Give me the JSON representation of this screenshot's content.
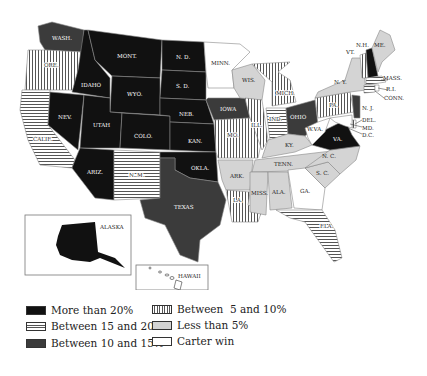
{
  "map": {
    "legend_colors": {
      "more_than_20": "#111111",
      "between_15_20": "horizontal-stripes",
      "between_10_15": "#3b3b3b",
      "between_5_10": "vertical-stripes",
      "less_than_5": "#d4d4d4",
      "carter_win": "#ffffff"
    },
    "states": {
      "wash": {
        "label": "WASH.",
        "category": "between_10_15"
      },
      "ore": {
        "label": "ORE.",
        "category": "between_5_10"
      },
      "calif": {
        "label": "CALIF.",
        "category": "between_15_20"
      },
      "idaho": {
        "label": "IDAHO",
        "category": "more_than_20"
      },
      "nev": {
        "label": "NEV.",
        "category": "more_than_20"
      },
      "mont": {
        "label": "MONT.",
        "category": "more_than_20"
      },
      "wyo": {
        "label": "WYO.",
        "category": "more_than_20"
      },
      "utah": {
        "label": "UTAH",
        "category": "more_than_20"
      },
      "colo": {
        "label": "COLO.",
        "category": "more_than_20"
      },
      "ariz": {
        "label": "ARIZ.",
        "category": "more_than_20"
      },
      "nm": {
        "label": "N. M.",
        "category": "between_15_20"
      },
      "nd": {
        "label": "N. D.",
        "category": "more_than_20"
      },
      "sd": {
        "label": "S. D.",
        "category": "more_than_20"
      },
      "neb": {
        "label": "NEB.",
        "category": "more_than_20"
      },
      "kan": {
        "label": "KAN.",
        "category": "more_than_20"
      },
      "okla": {
        "label": "OKLA.",
        "category": "more_than_20"
      },
      "texas": {
        "label": "TEXAS",
        "category": "between_10_15"
      },
      "minn": {
        "label": "MINN.",
        "category": "carter_win"
      },
      "iowa": {
        "label": "IOWA",
        "category": "between_10_15"
      },
      "mo": {
        "label": "MO.",
        "category": "between_5_10"
      },
      "ark": {
        "label": "ARK.",
        "category": "less_than_5"
      },
      "la": {
        "label": "LA.",
        "category": "between_5_10"
      },
      "wis": {
        "label": "WIS.",
        "category": "less_than_5"
      },
      "ill": {
        "label": "ILL.",
        "category": "between_5_10"
      },
      "mich": {
        "label": "MICH.",
        "category": "between_5_10"
      },
      "ind": {
        "label": "IND.",
        "category": "between_15_20"
      },
      "ohio": {
        "label": "OHIO",
        "category": "between_10_15"
      },
      "ky": {
        "label": "KY.",
        "category": "less_than_5"
      },
      "tenn": {
        "label": "TENN.",
        "category": "less_than_5"
      },
      "miss": {
        "label": "MISS.",
        "category": "less_than_5"
      },
      "ala": {
        "label": "ALA.",
        "category": "less_than_5"
      },
      "ga": {
        "label": "GA.",
        "category": "carter_win"
      },
      "fla": {
        "label": "FLA.",
        "category": "between_15_20"
      },
      "sc": {
        "label": "S. C.",
        "category": "less_than_5"
      },
      "nc": {
        "label": "N. C.",
        "category": "less_than_5"
      },
      "va": {
        "label": "VA.",
        "category": "more_than_20"
      },
      "wva": {
        "label": "W.VA.",
        "category": "carter_win"
      },
      "pa": {
        "label": "PA.",
        "category": "between_5_10"
      },
      "ny": {
        "label": "N. Y.",
        "category": "less_than_5"
      },
      "nj": {
        "label": "N. J.",
        "category": "between_10_15"
      },
      "del": {
        "label": "DEL.",
        "category": "between_5_10"
      },
      "md": {
        "label": "MD.",
        "category": "carter_win"
      },
      "dc": {
        "label": "D.C.",
        "category": "carter_win"
      },
      "vt": {
        "label": "VT.",
        "category": "between_5_10"
      },
      "nh": {
        "label": "N.H.",
        "category": "more_than_20"
      },
      "me": {
        "label": "ME.",
        "category": "less_than_5"
      },
      "mass": {
        "label": "MASS.",
        "category": "between_15_20"
      },
      "ri": {
        "label": "R.I.",
        "category": "carter_win"
      },
      "conn": {
        "label": "CONN.",
        "category": "between_15_20"
      },
      "alaska": {
        "label": "ALASKA",
        "category": "more_than_20"
      },
      "hawaii": {
        "label": "HAWAII",
        "category": "carter_win"
      }
    }
  },
  "legend": {
    "items": [
      {
        "label": "More than 20%",
        "key": "more_than_20"
      },
      {
        "label": "Between 15 and 20%",
        "key": "between_15_20"
      },
      {
        "label": "Between 10 and 15%",
        "key": "between_10_15"
      },
      {
        "label": "Between  5 and 10%",
        "key": "between_5_10"
      },
      {
        "label": "Less than 5%",
        "key": "less_than_5"
      },
      {
        "label": "Carter win",
        "key": "carter_win"
      }
    ]
  }
}
